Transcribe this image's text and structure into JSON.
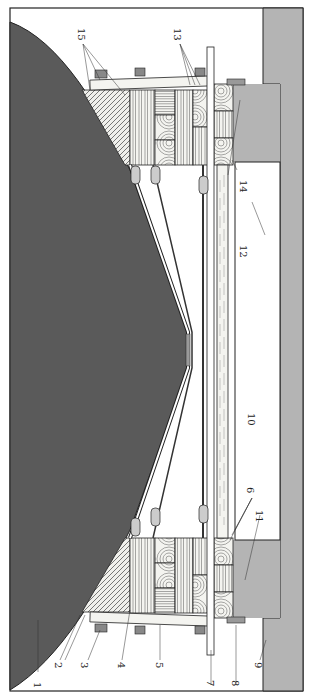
{
  "diagram": {
    "type": "technical cross-section drawing (rotated 90°)",
    "colors": {
      "background": "#ffffff",
      "dark_mass": "#5a5a5a",
      "gray_wall": "#b4b4b4",
      "outline": "#222222",
      "wood_face": "#f4f4f0",
      "steel_strip": "#9a9a9a"
    },
    "labels": [
      {
        "id": "1",
        "text": "1"
      },
      {
        "id": "2",
        "text": "2"
      },
      {
        "id": "3",
        "text": "3"
      },
      {
        "id": "4",
        "text": "4"
      },
      {
        "id": "5",
        "text": "5"
      },
      {
        "id": "6",
        "text": "6"
      },
      {
        "id": "7",
        "text": "7"
      },
      {
        "id": "8",
        "text": "8"
      },
      {
        "id": "9",
        "text": "9"
      },
      {
        "id": "10",
        "text": "10"
      },
      {
        "id": "11",
        "text": "11"
      },
      {
        "id": "12",
        "text": "12"
      },
      {
        "id": "13",
        "text": "13"
      },
      {
        "id": "14",
        "text": "14"
      },
      {
        "id": "15",
        "text": "15"
      }
    ]
  }
}
